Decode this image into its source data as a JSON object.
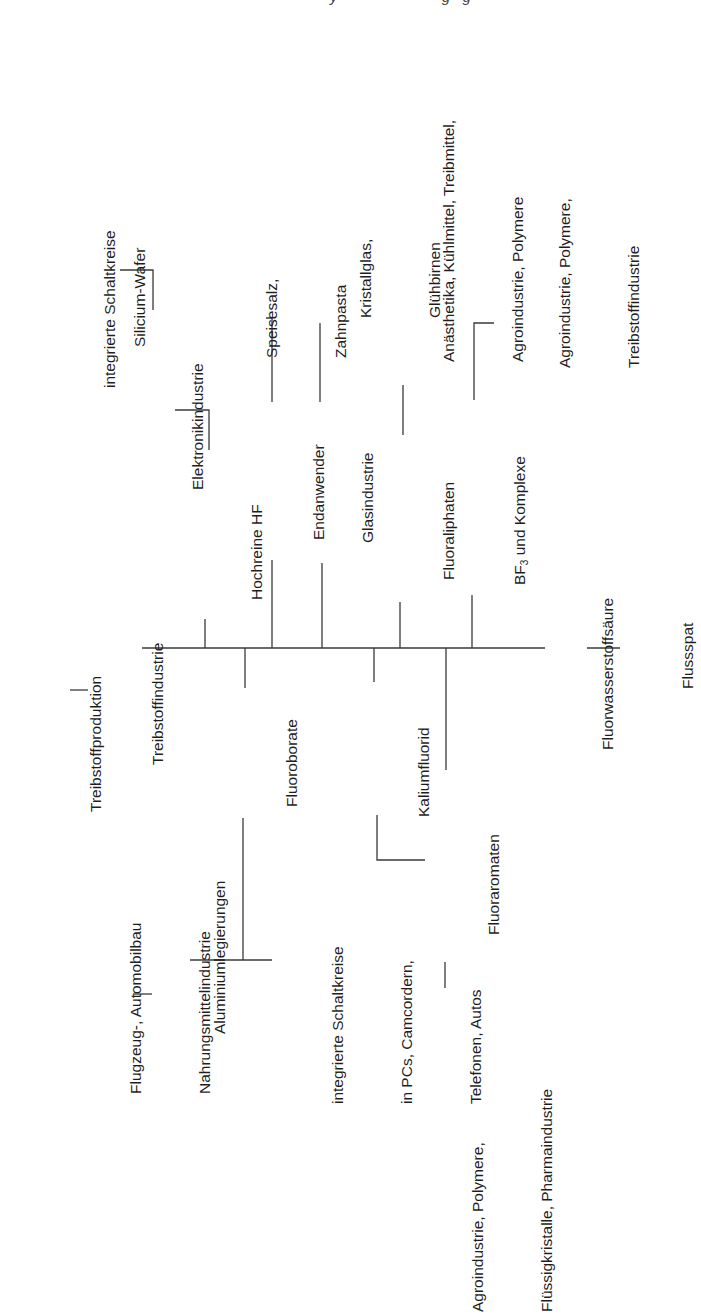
{
  "header_fragment": "y                         g   g",
  "diagram": {
    "root": "Flussspat",
    "level1": "Fluorwasserstoffsäure",
    "branches_up": {
      "hochreine_hf": "Hochreine HF",
      "elektronikindustrie": "Elektronikindustrie",
      "silicium_wafer": "Silicium-Wafer",
      "integrierte_schaltkreise": "integrierte Schaltkreise",
      "endanwender": "Endanwender",
      "speisesalz": [
        "Speisesalz,",
        "Zahnpasta"
      ],
      "glasindustrie": "Glasindustrie",
      "kristallglas": [
        "Kristallglas,",
        "Glühbirnen"
      ],
      "fluoraliphaten": "Fluoraliphaten",
      "anaesthetika": [
        "Anästhetika, Kühlmittel, Treibmittel,",
        "Agroindustrie, Polymere"
      ],
      "bf3_prefix": "BF",
      "bf3_sub": "3",
      "bf3_suffix": " und Komplexe",
      "bf3_uses": [
        "Agroindustrie, Polymere,",
        "Treibstoffindustrie"
      ]
    },
    "branches_down": {
      "fluoroborate": "Fluoroborate",
      "treibstoffindustrie": "Treibstoffindustrie",
      "treibstoffproduktion": "Treibstoffproduktion",
      "aluminiumlegierungen": "Aluminiumlegierungen",
      "flugzeug": [
        "Flugzeug-, Automobilbau",
        "Nahrungsmittelindustrie"
      ],
      "integrierte_pcs": [
        "integrierte Schaltkreise",
        "in PCs, Camcordern,",
        "Telefonen, Autos"
      ],
      "kaliumfluorid": "Kaliumfluorid",
      "fluoraromaten": "Fluoraromaten",
      "fluoraromaten_uses": [
        "Agroindustrie, Polymere,",
        "Flüssigkristalle, Pharmaindustrie"
      ]
    }
  }
}
